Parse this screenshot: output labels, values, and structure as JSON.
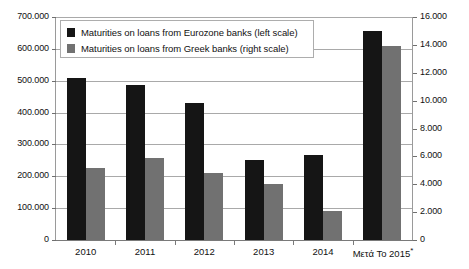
{
  "chart_data": {
    "type": "bar",
    "title": "",
    "subtitle": "",
    "xlabel": "",
    "ylabel": "",
    "categories": [
      "2010",
      "2011",
      "2012",
      "2013",
      "2014",
      "Μετά Το 2015*"
    ],
    "series": [
      {
        "name": "Maturities on loans from Eurozone banks (left scale)",
        "axis": "left",
        "color": "#151515",
        "values": [
          508000,
          487000,
          430000,
          250000,
          266000,
          655000
        ]
      },
      {
        "name": "Maturities on loans from Greek banks (right scale)",
        "axis": "right",
        "color": "#717171",
        "values": [
          5150,
          5850,
          4800,
          4000,
          2050,
          13900
        ]
      }
    ],
    "left_axis": {
      "min": 0,
      "max": 700000,
      "step": 100000,
      "ticks": [
        "0",
        "100.000",
        "200.000",
        "300.000",
        "400.000",
        "500.000",
        "600.000",
        "700.000"
      ]
    },
    "right_axis": {
      "min": 0,
      "max": 16000,
      "step": 2000,
      "ticks": [
        "0",
        "2.000",
        "4.000",
        "6.000",
        "8.000",
        "10.000",
        "12.000",
        "14.000",
        "16.000"
      ]
    },
    "grid": true,
    "legend_position": "top-left"
  },
  "legend": {
    "entries": [
      {
        "label": "Maturities on loans from Eurozone banks (left scale)"
      },
      {
        "label": "Maturities on loans from Greek banks (right scale)"
      }
    ]
  }
}
